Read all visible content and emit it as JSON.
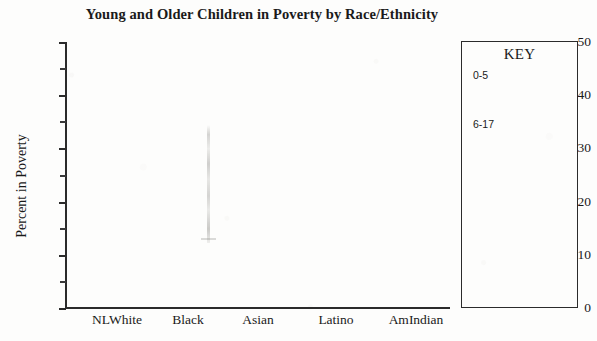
{
  "chart_data": {
    "type": "bar",
    "title": "Young and Older Children in Poverty by Race/Ethnicity",
    "xlabel": "",
    "ylabel": "Percent in Poverty",
    "categories": [
      "NLWhite",
      "Black",
      "Asian",
      "Latino",
      "AmIndian"
    ],
    "series": [
      {
        "name": "0-5",
        "values": [
          null,
          null,
          null,
          null,
          null
        ]
      },
      {
        "name": "6-17",
        "values": [
          null,
          null,
          null,
          null,
          null
        ]
      }
    ],
    "ylim": [
      0,
      50
    ],
    "y_major_ticks": [
      0,
      10,
      20,
      30,
      40,
      50
    ],
    "y_minor_ticks": [
      5,
      15,
      25,
      35,
      45
    ],
    "y_tick_labels": [
      "0",
      "10",
      "20",
      "30",
      "40",
      "50"
    ],
    "grid": false,
    "legend_position": "right",
    "legend_title": "KEY",
    "note": "Bars are not visible in this scan; plot area is blank apart from a faint vertical scan artifact."
  },
  "axes": {
    "y_title": "Percent in Poverty",
    "y_labels": [
      {
        "value": "50",
        "top": 35
      },
      {
        "value": "40",
        "top": 88
      },
      {
        "value": "30",
        "top": 141
      },
      {
        "value": "20",
        "top": 195
      },
      {
        "value": "10",
        "top": 248
      },
      {
        "value": "0",
        "top": 301
      }
    ],
    "y_major_tick_tops": [
      42,
      95,
      148,
      202,
      255,
      308
    ],
    "y_minor_tick_tops": [
      68,
      121,
      175,
      228,
      281
    ],
    "x_labels": [
      {
        "text": "NLWhite",
        "left": 117
      },
      {
        "text": "Black",
        "left": 188
      },
      {
        "text": "Asian",
        "left": 258
      },
      {
        "text": "Latino",
        "left": 336
      },
      {
        "text": "AmIndian",
        "left": 416
      }
    ]
  },
  "key": {
    "title": "KEY",
    "entries": [
      {
        "label": "0-5",
        "top": 28,
        "color": "#000000"
      },
      {
        "label": "6-17",
        "top": 77,
        "color": "#000000"
      }
    ]
  },
  "colors": {
    "ink": "#2b2b2b",
    "paper": "#fdfdfc"
  }
}
